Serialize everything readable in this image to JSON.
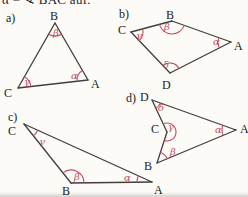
{
  "page": {
    "header_text": "α = ∢ BAC auf.",
    "colors": {
      "line": "#3f3f3f",
      "letter": "#1b1b1b",
      "angle": "#c14f63",
      "background": "#fcfbf7"
    }
  },
  "figures": [
    {
      "id": "a",
      "tag": "a)",
      "tag_pos": [
        6,
        12
      ],
      "vertices": [
        {
          "name": "B",
          "x": 55,
          "y": 23,
          "lx": 50,
          "ly": 10
        },
        {
          "name": "A",
          "x": 88,
          "y": 80,
          "lx": 91,
          "ly": 78
        },
        {
          "name": "C",
          "x": 18,
          "y": 88,
          "lx": 4,
          "ly": 87
        }
      ],
      "edges": [
        [
          "B",
          "A"
        ],
        [
          "B",
          "C"
        ],
        [
          "C",
          "A"
        ]
      ],
      "angles": [
        {
          "label": "β",
          "vertex": "B",
          "between": [
            "A",
            "C"
          ],
          "radius": 13,
          "lx": 53,
          "ly": 28
        },
        {
          "label": "α",
          "vertex": "A",
          "between": [
            "B",
            "C"
          ],
          "radius": 11,
          "lx": 71,
          "ly": 71
        },
        {
          "label": "γ",
          "vertex": "C",
          "between": [
            "B",
            "A"
          ],
          "radius": 13,
          "lx": 24,
          "ly": 77
        }
      ]
    },
    {
      "id": "b",
      "tag": "b)",
      "tag_pos": [
        119,
        8
      ],
      "vertices": [
        {
          "name": "B",
          "x": 172,
          "y": 21,
          "lx": 166,
          "ly": 9
        },
        {
          "name": "C",
          "x": 131,
          "y": 32,
          "lx": 118,
          "ly": 24
        },
        {
          "name": "A",
          "x": 231,
          "y": 42,
          "lx": 234,
          "ly": 40
        },
        {
          "name": "D",
          "x": 170,
          "y": 73,
          "lx": 162,
          "ly": 79
        }
      ],
      "edges": [
        [
          "C",
          "B"
        ],
        [
          "B",
          "A"
        ],
        [
          "A",
          "D"
        ],
        [
          "D",
          "C"
        ]
      ],
      "angles": [
        {
          "label": "β",
          "vertex": "B",
          "between": [
            "C",
            "A"
          ],
          "radius": 13,
          "lx": 164,
          "ly": 22
        },
        {
          "label": "γ",
          "vertex": "C",
          "between": [
            "B",
            "D"
          ],
          "radius": 12,
          "lx": 136,
          "ly": 31
        },
        {
          "label": "α",
          "vertex": "A",
          "between": [
            "B",
            "D"
          ],
          "radius": 13,
          "lx": 213,
          "ly": 37
        },
        {
          "label": "δ",
          "vertex": "D",
          "between": [
            "C",
            "A"
          ],
          "radius": 10,
          "lx": 163,
          "ly": 60
        }
      ]
    },
    {
      "id": "c",
      "tag": "c)",
      "tag_pos": [
        8,
        111
      ],
      "vertices": [
        {
          "name": "C",
          "x": 24,
          "y": 124,
          "lx": 8,
          "ly": 125
        },
        {
          "name": "B",
          "x": 71,
          "y": 183,
          "lx": 62,
          "ly": 185
        },
        {
          "name": "A",
          "x": 152,
          "y": 182,
          "lx": 154,
          "ly": 184
        }
      ],
      "edges": [
        [
          "C",
          "B"
        ],
        [
          "C",
          "A"
        ],
        [
          "B",
          "A"
        ]
      ],
      "angles": [
        {
          "label": "γ",
          "vertex": "C",
          "between": [
            "B",
            "A"
          ],
          "radius": 15,
          "lx": 39,
          "ly": 137
        },
        {
          "label": "β",
          "vertex": "B",
          "between": [
            "C",
            "A"
          ],
          "radius": 13,
          "lx": 74,
          "ly": 172
        },
        {
          "label": "α",
          "vertex": "A",
          "between": [
            "C",
            "B"
          ],
          "radius": 15,
          "lx": 124,
          "ly": 173
        }
      ]
    },
    {
      "id": "d",
      "tag": "d)",
      "tag_pos": [
        126,
        92
      ],
      "vertices": [
        {
          "name": "D",
          "x": 152,
          "y": 100,
          "lx": 140,
          "ly": 91
        },
        {
          "name": "A",
          "x": 236,
          "y": 130,
          "lx": 240,
          "ly": 123
        },
        {
          "name": "B",
          "x": 157,
          "y": 163,
          "lx": 144,
          "ly": 160
        },
        {
          "name": "C",
          "x": 167,
          "y": 132,
          "lx": 151,
          "ly": 123
        }
      ],
      "edges": [
        [
          "D",
          "A"
        ],
        [
          "A",
          "B"
        ],
        [
          "B",
          "C"
        ],
        [
          "C",
          "D"
        ]
      ],
      "angles": [
        {
          "label": "δ",
          "vertex": "D",
          "between": [
            "C",
            "A"
          ],
          "radius": 9,
          "lx": 158,
          "ly": 103
        },
        {
          "label": "γ",
          "vertex": "C",
          "between": [
            "B",
            "D"
          ],
          "radius": 9,
          "reflex": true,
          "lx": 168,
          "ly": 122
        },
        {
          "label": "α",
          "vertex": "A",
          "between": [
            "D",
            "B"
          ],
          "radius": 14,
          "lx": 215,
          "ly": 125
        },
        {
          "label": "β",
          "vertex": "B",
          "between": [
            "A",
            "C"
          ],
          "radius": 11,
          "lx": 170,
          "ly": 147
        }
      ]
    }
  ]
}
